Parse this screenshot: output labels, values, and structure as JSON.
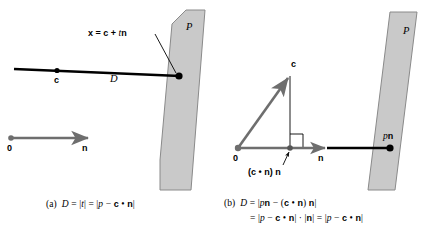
{
  "figure": {
    "background_color": "#ffffff",
    "plane_fill": "#c9c9c9",
    "plane_stroke": "#8a8a8a",
    "vector_gray": "#6e6e6e",
    "line_black": "#000000"
  },
  "panel_a": {
    "plane_label": "P",
    "point_c_label": "c",
    "distance_label": "D",
    "origin_label": "0",
    "normal_label": "n",
    "ray_equation": {
      "lhs": "x",
      "eq": " = ",
      "rhs_c": "c",
      "plus": " + ",
      "rhs_t": "t",
      "rhs_n": "n",
      "full": "x = c + tn"
    },
    "caption": {
      "tag": "(a)",
      "text": "D = |t| = |p − c • n|",
      "parts": {
        "D": "D",
        "eq1": "= |",
        "t": "t",
        "bar_eq": "| = |",
        "p": "p",
        "minus": " − ",
        "c": "c",
        "dot": " • ",
        "n": "n",
        "close": "|"
      }
    }
  },
  "panel_b": {
    "plane_label": "P",
    "origin_label": "0",
    "vector_c_label": "c",
    "normal_label": "n",
    "projection_label": {
      "open": "(",
      "c": "c",
      "dot": " • ",
      "n": "n",
      "close": ")",
      "n2": "n",
      "full": "(c • n) n"
    },
    "plane_point_label": {
      "p": "p",
      "n": "n",
      "full": "pn"
    },
    "caption": {
      "tag": "(b)",
      "line1": "D = |pn − (c • n) n|",
      "line2": "= |p − c • n| · |n| = |p − c • n|",
      "parts": {
        "D": "D",
        "eq": "=",
        "p": "p",
        "n": "n",
        "c": "c",
        "dot": "•",
        "minus": "−",
        "cdot": "·"
      }
    }
  }
}
